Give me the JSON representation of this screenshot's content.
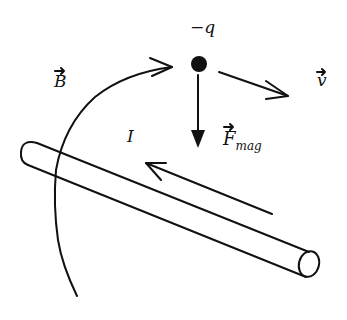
{
  "diagram": {
    "labels": {
      "charge": "−q",
      "magnetic_field": "B",
      "velocity": "v",
      "force_main": "F",
      "force_sub": "mag",
      "current": "I"
    },
    "elements": [
      {
        "id": "charge",
        "kind": "point-charge",
        "sign": "negative"
      },
      {
        "id": "magnetic-field-line",
        "kind": "curved-arrow",
        "direction": "toward charge (clockwise around wire)"
      },
      {
        "id": "velocity-vector",
        "kind": "arrow",
        "direction": "right and slightly down"
      },
      {
        "id": "magnetic-force-vector",
        "kind": "arrow",
        "direction": "down (toward wire)"
      },
      {
        "id": "wire",
        "kind": "cylinder",
        "orientation": "diagonal, upper-left to lower-right"
      },
      {
        "id": "current-arrow",
        "kind": "arrow",
        "direction": "up-left along wire"
      }
    ],
    "colors": {
      "ink": "#111111",
      "background": "#ffffff"
    }
  }
}
